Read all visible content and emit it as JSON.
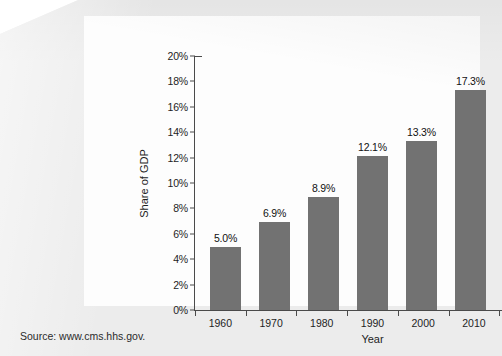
{
  "source_note": "Source: www.cms.hhs.gov.",
  "colors": {
    "bar": "#727272",
    "axis": "#4a4a4a",
    "text": "#1e1e1e",
    "page": "#ececec",
    "card": "#fdfdfd"
  },
  "chart_data": {
    "type": "bar",
    "title": "",
    "xlabel": "Year",
    "ylabel": "Share of GDP",
    "categories": [
      "1960",
      "1970",
      "1980",
      "1990",
      "2000",
      "2010",
      "2014"
    ],
    "values": [
      5.0,
      6.9,
      8.9,
      12.1,
      13.3,
      17.3,
      17.5
    ],
    "value_labels": [
      "5.0%",
      "6.9%",
      "8.9%",
      "12.1%",
      "13.3%",
      "17.3%",
      "17.5%"
    ],
    "ylim": [
      0,
      20
    ],
    "ytick_values": [
      0,
      2,
      4,
      6,
      8,
      10,
      12,
      14,
      16,
      18,
      20
    ],
    "ytick_labels": [
      "0%",
      "2%",
      "4%",
      "6%",
      "8%",
      "10%",
      "12%",
      "14%",
      "16%",
      "18%",
      "20%"
    ],
    "grid": false,
    "legend": false
  }
}
